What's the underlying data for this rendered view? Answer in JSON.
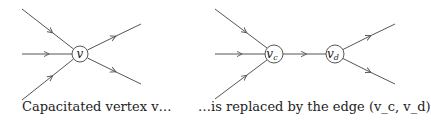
{
  "left_diagram": {
    "node": {
      "label": "v",
      "cx": 80,
      "cy": 54,
      "r": 8
    },
    "caption": "Capacitated vertex v…",
    "caption_x": 22
  },
  "right_diagram": {
    "nodes": [
      {
        "label": "v",
        "sub": "c",
        "cx": 274,
        "cy": 54,
        "r": 9
      },
      {
        "label": "v",
        "sub": "d",
        "cx": 335,
        "cy": 54,
        "r": 9
      }
    ],
    "caption": "…is replaced by the edge (v_c, v_d)",
    "caption_x": 198
  },
  "colors": {
    "stroke": "#555555",
    "text": "#222222"
  }
}
